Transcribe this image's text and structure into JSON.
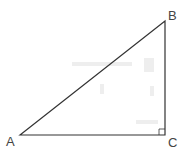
{
  "diagram": {
    "type": "right-triangle",
    "stroke_color": "#333333",
    "label_color": "#444444",
    "vertices": [
      {
        "id": "A",
        "label": "A",
        "x": 20,
        "y": 135,
        "label_x": 6,
        "label_y": 146
      },
      {
        "id": "B",
        "label": "B",
        "x": 165,
        "y": 21,
        "label_x": 168,
        "label_y": 20
      },
      {
        "id": "C",
        "label": "C",
        "x": 165,
        "y": 135,
        "label_x": 168,
        "label_y": 147
      }
    ],
    "right_angle_at": "C",
    "right_angle_marker_size": 6
  }
}
